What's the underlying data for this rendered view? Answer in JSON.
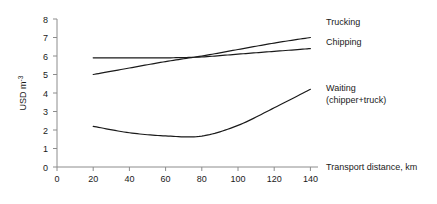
{
  "chart_data": {
    "type": "line",
    "title": "",
    "xlabel": "Transport distance, km",
    "ylabel": "USD m",
    "ylabel_superscript": "-3",
    "xlim": [
      0,
      140
    ],
    "ylim": [
      0,
      8
    ],
    "xticks": [
      0,
      20,
      40,
      60,
      80,
      100,
      120,
      140
    ],
    "yticks": [
      0,
      1,
      2,
      3,
      4,
      5,
      6,
      7,
      8
    ],
    "grid": false,
    "legend_position": "right-inline",
    "x": [
      20,
      40,
      60,
      80,
      100,
      120,
      140
    ],
    "series": [
      {
        "name": "Trucking",
        "label": "Trucking",
        "label_line2": "",
        "color": "#1a1a1a",
        "values": [
          5.0,
          5.35,
          5.7,
          6.0,
          6.35,
          6.7,
          7.0
        ]
      },
      {
        "name": "Chipping",
        "label": "Chipping",
        "label_line2": "",
        "color": "#1a1a1a",
        "values": [
          5.9,
          5.9,
          5.9,
          5.95,
          6.1,
          6.25,
          6.4
        ]
      },
      {
        "name": "Waiting",
        "label": "Waiting",
        "label_line2": "(chipper+truck)",
        "color": "#1a1a1a",
        "values": [
          2.2,
          1.85,
          1.68,
          1.67,
          2.25,
          3.2,
          4.2
        ]
      }
    ]
  },
  "axes": {
    "x_tick_labels": [
      "0",
      "20",
      "40",
      "60",
      "80",
      "100",
      "120",
      "140"
    ],
    "y_tick_labels": [
      "0",
      "1",
      "2",
      "3",
      "4",
      "5",
      "6",
      "7",
      "8"
    ],
    "x_axis_title": "Transport distance, km",
    "y_axis_title_main": "USD m",
    "y_axis_title_exp": "-3"
  },
  "annotations": {
    "trucking_label": "Trucking",
    "chipping_label": "Chipping",
    "waiting_label_line1": "Waiting",
    "waiting_label_line2": "(chipper+truck)"
  }
}
